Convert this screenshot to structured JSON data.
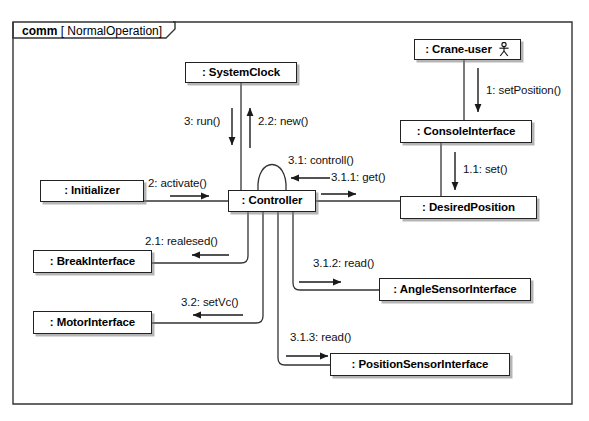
{
  "diagram": {
    "kind": "UML Communication Diagram",
    "frame": {
      "kind_label": "comm",
      "operand_label": "[ NormalOperation]"
    },
    "lifelines": [
      {
        "id": "system-clock",
        "label": ": SystemClock",
        "actor": false
      },
      {
        "id": "crane-user",
        "label": ": Crane-user",
        "actor": true
      },
      {
        "id": "console-interface",
        "label": ": ConsoleInterface",
        "actor": false
      },
      {
        "id": "desired-position",
        "label": ": DesiredPosition",
        "actor": false
      },
      {
        "id": "initializer",
        "label": ": Initializer",
        "actor": false
      },
      {
        "id": "controller",
        "label": ": Controller",
        "actor": false
      },
      {
        "id": "break-interface",
        "label": ": BreakInterface",
        "actor": false
      },
      {
        "id": "motor-interface",
        "label": ": MotorInterface",
        "actor": false
      },
      {
        "id": "angle-sensor-interface",
        "label": ": AngleSensorInterface",
        "actor": false
      },
      {
        "id": "position-sensor-interface",
        "label": ": PositionSensorInterface",
        "actor": false
      }
    ],
    "messages": [
      {
        "id": "m1",
        "label": "1: setPosition()",
        "from": "crane-user",
        "to": "console-interface"
      },
      {
        "id": "m1-1",
        "label": "1.1: set()",
        "from": "console-interface",
        "to": "desired-position"
      },
      {
        "id": "m2",
        "label": "2: activate()",
        "from": "initializer",
        "to": "controller"
      },
      {
        "id": "m2-1",
        "label": "2.1: realesed()",
        "from": "controller",
        "to": "break-interface"
      },
      {
        "id": "m2-2",
        "label": "2.2: new()",
        "from": "controller",
        "to": "system-clock"
      },
      {
        "id": "m3",
        "label": "3: run()",
        "from": "system-clock",
        "to": "controller"
      },
      {
        "id": "m3-1",
        "label": "3.1: controll()",
        "from": "controller",
        "to": "controller"
      },
      {
        "id": "m3-1-1",
        "label": "3.1.1: get()",
        "from": "desired-position",
        "to": "controller"
      },
      {
        "id": "m3-1-2",
        "label": "3.1.2: read()",
        "from": "controller",
        "to": "angle-sensor-interface"
      },
      {
        "id": "m3-1-3",
        "label": "3.1.3: read()",
        "from": "controller",
        "to": "position-sensor-interface"
      },
      {
        "id": "m3-2",
        "label": "3.2: setVc()",
        "from": "controller",
        "to": "motor-interface"
      }
    ],
    "colors": {
      "background": "#ffffff",
      "stroke": "#222222",
      "text": "#000000",
      "shadow": "#787878"
    }
  }
}
